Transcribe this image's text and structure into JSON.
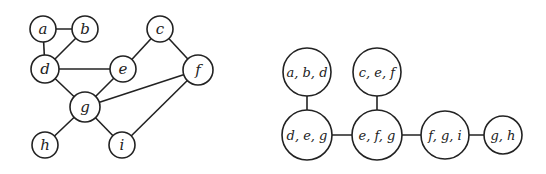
{
  "graph": {
    "nodes": [
      {
        "id": "a",
        "label": "a",
        "x": 43,
        "y": 29,
        "r": 13
      },
      {
        "id": "b",
        "label": "b",
        "x": 85,
        "y": 29,
        "r": 13
      },
      {
        "id": "c",
        "label": "c",
        "x": 160,
        "y": 29,
        "r": 13
      },
      {
        "id": "d",
        "label": "d",
        "x": 45,
        "y": 69,
        "r": 14
      },
      {
        "id": "e",
        "label": "e",
        "x": 123,
        "y": 69,
        "r": 13
      },
      {
        "id": "f",
        "label": "f",
        "x": 198,
        "y": 70,
        "r": 15
      },
      {
        "id": "g",
        "label": "g",
        "x": 85,
        "y": 107,
        "r": 15
      },
      {
        "id": "h",
        "label": "h",
        "x": 45,
        "y": 145,
        "r": 13
      },
      {
        "id": "i",
        "label": "i",
        "x": 122,
        "y": 145,
        "r": 13
      }
    ],
    "edges": [
      [
        "a",
        "b"
      ],
      [
        "a",
        "d"
      ],
      [
        "b",
        "d"
      ],
      [
        "d",
        "e"
      ],
      [
        "d",
        "g"
      ],
      [
        "c",
        "e"
      ],
      [
        "c",
        "f"
      ],
      [
        "e",
        "g"
      ],
      [
        "f",
        "g"
      ],
      [
        "f",
        "i"
      ],
      [
        "g",
        "h"
      ],
      [
        "g",
        "i"
      ]
    ]
  },
  "clique_tree": {
    "nodes": [
      {
        "id": "abd",
        "label": "a, b, d",
        "x": 307,
        "y": 72,
        "r": 24
      },
      {
        "id": "cef",
        "label": "c, e, f",
        "x": 377,
        "y": 72,
        "r": 24
      },
      {
        "id": "deg",
        "label": "d, e, g",
        "x": 307,
        "y": 135,
        "r": 25
      },
      {
        "id": "efg",
        "label": "e, f, g",
        "x": 377,
        "y": 135,
        "r": 25
      },
      {
        "id": "fgi",
        "label": "f, g, i",
        "x": 445,
        "y": 135,
        "r": 24
      },
      {
        "id": "gh",
        "label": "g, h",
        "x": 503,
        "y": 135,
        "r": 19
      }
    ],
    "edges": [
      [
        "abd",
        "deg"
      ],
      [
        "cef",
        "efg"
      ],
      [
        "deg",
        "efg"
      ],
      [
        "efg",
        "fgi"
      ],
      [
        "fgi",
        "gh"
      ]
    ]
  }
}
